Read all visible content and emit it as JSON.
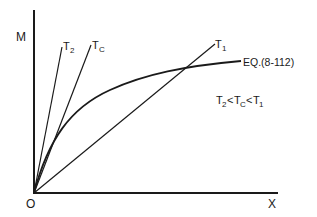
{
  "diagram": {
    "axes": {
      "y_label": "M",
      "x_label": "X",
      "origin_label": "O"
    },
    "lines": [
      {
        "label": "T",
        "sub": "2",
        "name": "T2"
      },
      {
        "label": "T",
        "sub": "C",
        "name": "Tc"
      },
      {
        "label": "T",
        "sub": "1",
        "name": "T1"
      }
    ],
    "curve": {
      "label": "EQ.(8-112)"
    },
    "relation": {
      "parts": [
        {
          "t": "T",
          "s": "2"
        },
        {
          "op": "<"
        },
        {
          "t": "T",
          "s": "C"
        },
        {
          "op": "<"
        },
        {
          "t": "T",
          "s": "1"
        }
      ],
      "text": "T2<TC<T1"
    },
    "colors": {
      "ink": "#1a1a1a",
      "background": "#ffffff"
    }
  }
}
